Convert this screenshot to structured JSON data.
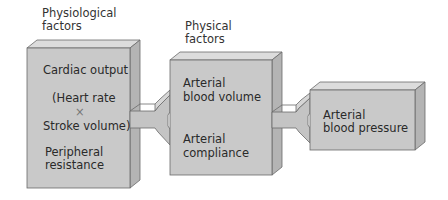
{
  "diagram": {
    "colors": {
      "front": "#c9c9c9",
      "top": "#dcdcdc",
      "side": "#b4b4b4",
      "stroke": "#6a6a6a",
      "arrow": "#c4c4c4"
    },
    "headers": {
      "physiological": [
        "Physiological",
        "factors"
      ],
      "physical": [
        "Physical",
        "factors"
      ]
    },
    "boxes": [
      {
        "id": "physiological-box",
        "items": [
          "Cardiac output",
          "(Heart rate",
          "×",
          "Stroke volume)",
          "Peripheral",
          "resistance"
        ]
      },
      {
        "id": "physical-box",
        "items": [
          "Arterial",
          "blood volume",
          "Arterial",
          "compliance"
        ]
      },
      {
        "id": "result-box",
        "items": [
          "Arterial",
          "blood pressure"
        ]
      }
    ]
  }
}
